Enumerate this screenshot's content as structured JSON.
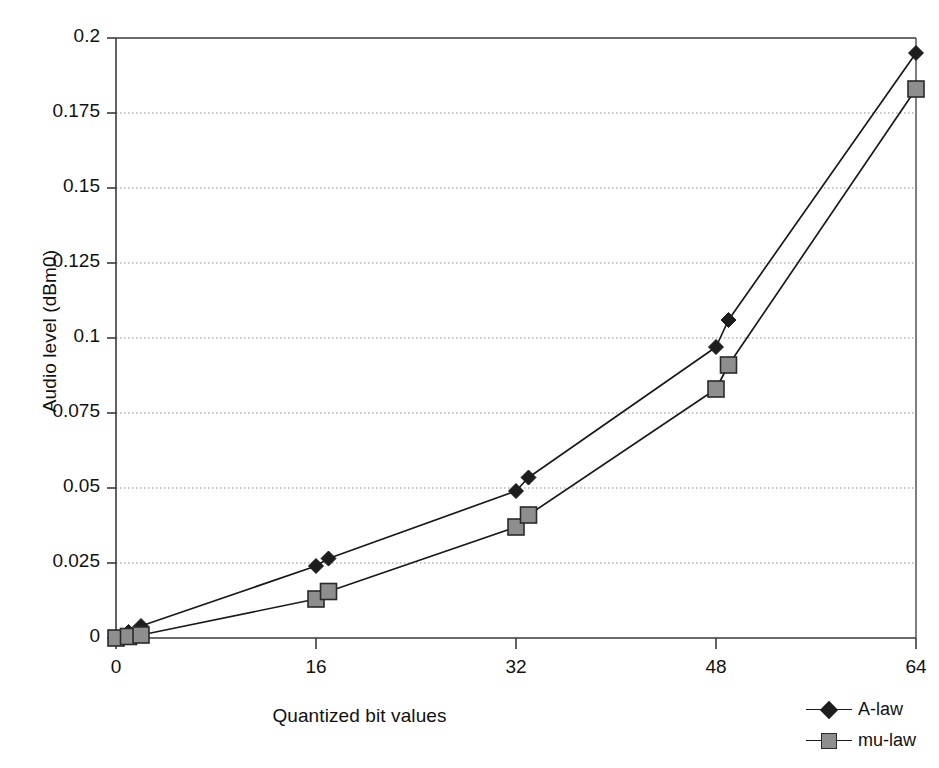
{
  "chart_data": {
    "type": "line",
    "title": "",
    "subtitle": "",
    "xlabel": "Quantized bit values",
    "ylabel": "Audio level (dBm0)",
    "xlim": [
      0,
      64
    ],
    "ylim": [
      0,
      0.2
    ],
    "xticks": [
      0,
      16,
      32,
      48,
      64
    ],
    "xtick_labels": [
      "0",
      "16",
      "32",
      "48",
      "64"
    ],
    "yticks": [
      0,
      0.025,
      0.05,
      0.075,
      0.1,
      0.125,
      0.15,
      0.175,
      0.2
    ],
    "ytick_labels": [
      "0",
      "0.025",
      "0.05",
      "0.075",
      "0.1",
      "0.125",
      "0.15",
      "0.175",
      "0.2"
    ],
    "grid": "horizontal-dotted",
    "legend_position": "bottom-right",
    "series": [
      {
        "name": "A-law",
        "marker": "diamond",
        "marker_color": "#1d1d1d",
        "line_color": "#1a1a1a",
        "x": [
          0,
          1,
          2,
          16,
          17,
          32,
          33,
          48,
          49,
          64
        ],
        "y": [
          0.0,
          0.002,
          0.004,
          0.024,
          0.0265,
          0.049,
          0.0535,
          0.097,
          0.106,
          0.195
        ]
      },
      {
        "name": "mu-law",
        "marker": "square",
        "marker_color": "#8e8e8e",
        "line_color": "#1a1a1a",
        "x": [
          0,
          1,
          2,
          16,
          17,
          32,
          33,
          48,
          49,
          64
        ],
        "y": [
          0.0,
          0.0005,
          0.001,
          0.013,
          0.0155,
          0.037,
          0.041,
          0.083,
          0.091,
          0.183
        ]
      }
    ]
  },
  "axes": {
    "x_title": "Quantized bit values",
    "y_title": "Audio level (dBm0)"
  },
  "legend": {
    "entries": [
      {
        "label": "A-law",
        "marker": "diamond-marker-icon"
      },
      {
        "label": "mu-law",
        "marker": "square-marker-icon"
      }
    ]
  },
  "colors": {
    "a_law_marker": "#1d1d1d",
    "mu_law_marker": "#8e8e8e",
    "line": "#1a1a1a",
    "axis": "#3a3a3a",
    "grid": "#8a8a8a",
    "background": "#ffffff"
  }
}
